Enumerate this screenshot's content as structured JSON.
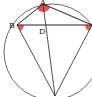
{
  "diagram": {
    "type": "circle-geometry",
    "points": {
      "A": {
        "label": "A",
        "x": 43,
        "y": 4
      },
      "B": {
        "label": "B",
        "x": 17,
        "y": 25
      },
      "C": {
        "label": "C",
        "x": 91,
        "y": 25
      },
      "D": {
        "label": "D",
        "x": 45,
        "y": 25
      },
      "E": {
        "label": "E",
        "x": 55,
        "y": 96
      }
    },
    "circle": {
      "cx": 52,
      "cy": 52,
      "r": 48
    },
    "segments": [
      "AB",
      "AC",
      "BC",
      "BE",
      "CE",
      "AE"
    ],
    "angle_markers": [
      "A",
      "B",
      "C"
    ],
    "colors": {
      "stroke": "#333333",
      "marker": "#e8392f"
    }
  }
}
